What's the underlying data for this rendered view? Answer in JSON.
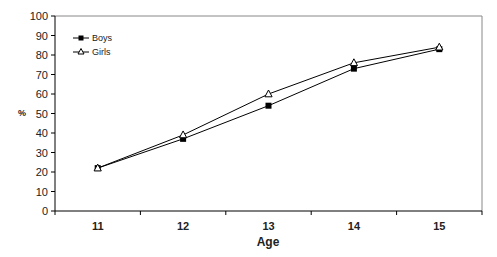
{
  "chart_data": {
    "type": "line",
    "title": "",
    "xlabel": "Age",
    "ylabel": "%",
    "categories": [
      "11",
      "12",
      "13",
      "14",
      "15"
    ],
    "x": [
      11,
      12,
      13,
      14,
      15
    ],
    "series": [
      {
        "name": "Boys",
        "marker": "filled-square",
        "color": "#000000",
        "values": [
          22,
          37,
          54,
          73,
          83
        ]
      },
      {
        "name": "Girls",
        "marker": "open-triangle",
        "color": "#000000",
        "values": [
          22,
          39,
          60,
          76,
          84
        ]
      }
    ],
    "ylim": [
      0,
      100
    ],
    "yticks": [
      0,
      10,
      20,
      30,
      40,
      50,
      60,
      70,
      80,
      90,
      100
    ],
    "grid": false,
    "legend_position": "upper-left-inside"
  },
  "labels": {
    "xlabel": "Age",
    "ylabel": "%",
    "legend_boys": "Boys",
    "legend_girls": "Girls"
  }
}
